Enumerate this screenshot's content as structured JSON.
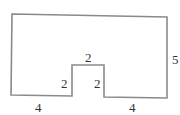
{
  "diagram": {
    "type": "rectilinear-polygon-with-notch",
    "stroke_color": "#8a8a8a",
    "text_color": "#333333",
    "outline_points": [
      [
        12,
        14
      ],
      [
        167,
        17
      ],
      [
        167,
        98
      ],
      [
        104,
        97
      ],
      [
        104,
        65
      ],
      [
        72,
        65
      ],
      [
        72,
        96
      ],
      [
        11,
        95
      ]
    ],
    "labels": {
      "bottom_left": "4",
      "notch_left": "2",
      "notch_top": "2",
      "notch_right": "2",
      "bottom_right": "4",
      "right_side": "5"
    }
  }
}
